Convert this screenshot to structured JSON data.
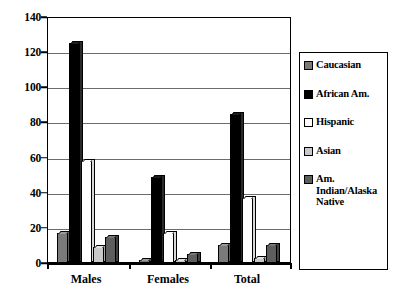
{
  "chart_data": {
    "type": "bar",
    "title": "",
    "xlabel": "",
    "ylabel": "",
    "ylim": [
      0,
      140
    ],
    "ytick_step": 20,
    "yticks": [
      0,
      20,
      40,
      60,
      80,
      100,
      120,
      140
    ],
    "ytick_labels": [
      "0",
      "20",
      "40",
      "60",
      "80",
      "100",
      "120",
      "140"
    ],
    "categories": [
      "Males",
      "Females",
      "Total"
    ],
    "grid": true,
    "legend_position": "right",
    "series": [
      {
        "name": "Caucasian",
        "color": "#7a7a7a",
        "values": [
          17,
          2,
          10
        ]
      },
      {
        "name": "African Am.",
        "color": "#000000",
        "values": [
          125,
          49,
          85
        ]
      },
      {
        "name": "Hispanic",
        "color": "#ffffff",
        "values": [
          58,
          17,
          37
        ]
      },
      {
        "name": "Asian",
        "color": "#c9c9c9",
        "values": [
          9,
          2,
          3
        ]
      },
      {
        "name": "Am. Indian/Alaska Native",
        "color": "#5e5e5e",
        "values": [
          15,
          5,
          10
        ]
      }
    ]
  },
  "legend": {
    "items": [
      {
        "label": "Caucasian"
      },
      {
        "label": "African Am."
      },
      {
        "label": "Hispanic"
      },
      {
        "label": "Am. Indian/Alaska Native"
      },
      {
        "label": "Asian"
      }
    ]
  }
}
